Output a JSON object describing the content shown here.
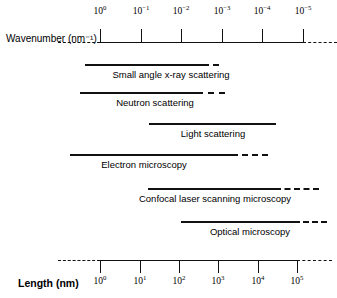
{
  "figure": {
    "type": "range-diagram",
    "width": 337,
    "height": 298,
    "background": "#ffffff",
    "line_color": "#111111"
  },
  "top_axis": {
    "title": "Wavenumber (nm⁻¹)",
    "title_x": 6,
    "title_y": 33,
    "line_y": 42,
    "line_x1": 100,
    "line_x2": 303,
    "dash_left": {
      "x1": 58,
      "x2": 100
    },
    "dash_right": {
      "x1": 303,
      "x2": 337
    },
    "tick_direction": "up",
    "tick_length": 13,
    "ticks": [
      {
        "label_base": "10",
        "label_exp": "0",
        "x": 100
      },
      {
        "label_base": "10",
        "label_exp": "−1",
        "x": 141
      },
      {
        "label_base": "10",
        "label_exp": "−2",
        "x": 181
      },
      {
        "label_base": "10",
        "label_exp": "−3",
        "x": 222
      },
      {
        "label_base": "10",
        "label_exp": "−4",
        "x": 262
      },
      {
        "label_base": "10",
        "label_exp": "−5",
        "x": 303
      }
    ],
    "tick_label_y": 6
  },
  "bottom_axis": {
    "title": "Length (nm)",
    "title_x": 18,
    "title_y": 277,
    "line_y": 260,
    "line_x1": 100,
    "line_x2": 297,
    "dash_left": {
      "x1": 58,
      "x2": 100
    },
    "dash_right": {
      "x1": 297,
      "x2": 332
    },
    "tick_direction": "down",
    "tick_length": 13,
    "ticks": [
      {
        "label_base": "10",
        "label_exp": "0",
        "x": 100
      },
      {
        "label_base": "10",
        "label_exp": "1",
        "x": 140
      },
      {
        "label_base": "10",
        "label_exp": "2",
        "x": 179
      },
      {
        "label_base": "10",
        "label_exp": "3",
        "x": 218
      },
      {
        "label_base": "10",
        "label_exp": "4",
        "x": 258
      },
      {
        "label_base": "10",
        "label_exp": "5",
        "x": 297
      }
    ],
    "tick_label_y": 276
  },
  "bands": [
    {
      "name": "small-angle-x-ray-scattering",
      "caption": "Small angle x-ray scattering",
      "line_y": 64,
      "caption_y": 69,
      "caption_x": 171,
      "dash_left": {
        "x1": 85,
        "x2": 95
      },
      "solid": {
        "x1": 95,
        "x2": 203
      },
      "dash_right": {
        "x1": 203,
        "x2": 219
      }
    },
    {
      "name": "neutron-scattering",
      "caption": "Neutron scattering",
      "line_y": 92,
      "caption_y": 97,
      "caption_x": 155,
      "dash_left": {
        "x1": 80,
        "x2": 90
      },
      "solid": {
        "x1": 90,
        "x2": 197
      },
      "dash_right": {
        "x1": 197,
        "x2": 225
      }
    },
    {
      "name": "light-scattering",
      "caption": "Light scattering",
      "line_y": 123,
      "caption_y": 128,
      "caption_x": 213,
      "dash_left": {
        "x1": 149,
        "x2": 158
      },
      "solid": {
        "x1": 158,
        "x2": 266
      },
      "dash_right": {
        "x1": 266,
        "x2": 276
      }
    },
    {
      "name": "electron-microscopy",
      "caption": "Electron microscopy",
      "line_y": 154,
      "caption_y": 159,
      "caption_x": 144,
      "dash_left": {
        "x1": 70,
        "x2": 80
      },
      "solid": {
        "x1": 80,
        "x2": 232
      },
      "dash_right": {
        "x1": 232,
        "x2": 268
      }
    },
    {
      "name": "confocal-laser-scanning-microscopy",
      "caption": "Confocal laser scanning microscopy",
      "line_y": 188,
      "caption_y": 193,
      "caption_x": 215,
      "dash_left": {
        "x1": 148,
        "x2": 158
      },
      "solid": {
        "x1": 158,
        "x2": 275
      },
      "dash_right": {
        "x1": 275,
        "x2": 319
      }
    },
    {
      "name": "optical-microscopy",
      "caption": "Optical microscopy",
      "line_y": 221,
      "caption_y": 226,
      "caption_x": 250,
      "dash_left": {
        "x1": 181,
        "x2": 190
      },
      "solid": {
        "x1": 190,
        "x2": 294
      },
      "dash_right": {
        "x1": 294,
        "x2": 327
      }
    }
  ]
}
